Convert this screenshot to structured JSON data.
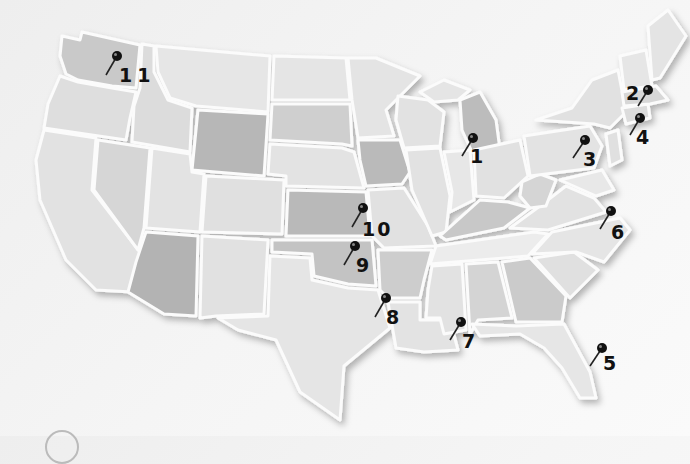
{
  "map": {
    "title": "United States map with numbered location pins",
    "colors": {
      "background": "#f3f3f3",
      "state_light": "#e4e4e4",
      "state_mid": "#d2d2d2",
      "state_dark": "#b8b8b8",
      "border": "#fbfbfb",
      "pin": "#111111"
    },
    "pins": [
      {
        "number": "1",
        "location": "Indiana / Illinois",
        "x": 473,
        "y": 138
      },
      {
        "number": "2",
        "location": "Massachusetts",
        "x": 648,
        "y": 90
      },
      {
        "number": "3",
        "location": "Pennsylvania",
        "x": 585,
        "y": 140
      },
      {
        "number": "4",
        "location": "New Jersey / New York",
        "x": 640,
        "y": 118
      },
      {
        "number": "5",
        "location": "Florida",
        "x": 602,
        "y": 348
      },
      {
        "number": "6",
        "location": "North Carolina",
        "x": 611,
        "y": 211
      },
      {
        "number": "7",
        "location": "Mississippi / Louisiana",
        "x": 461,
        "y": 322
      },
      {
        "number": "8",
        "location": "Texas / Louisiana",
        "x": 386,
        "y": 298
      },
      {
        "number": "9",
        "location": "Oklahoma",
        "x": 355,
        "y": 246
      },
      {
        "number": "10",
        "location": "Kansas",
        "x": 363,
        "y": 208
      },
      {
        "number": "11",
        "location": "Washington",
        "x": 117,
        "y": 56
      }
    ]
  }
}
